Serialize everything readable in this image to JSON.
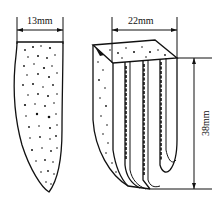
{
  "diagram": {
    "type": "technical illustration",
    "left_object": {
      "description": "single porous blade-shaped specimen (side view)",
      "width_label": "13mm"
    },
    "right_object": {
      "description": "grooved/fluted porous specimen (3D view)",
      "width_label": "22mm",
      "height_label": "38mm"
    },
    "colors": {
      "line": "#111111",
      "background": "#ffffff"
    }
  }
}
